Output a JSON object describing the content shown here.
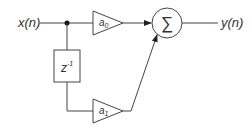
{
  "diagram": {
    "type": "signal-flow block diagram",
    "input_label": "x(n)",
    "output_label": "y(n)",
    "delay": {
      "base": "z",
      "exponent": "-1"
    },
    "gain_top": {
      "base": "a",
      "sub": "0"
    },
    "gain_bottom": {
      "base": "a",
      "sub": "1"
    },
    "sum_symbol": "∑",
    "colors": {
      "stroke": "#444444",
      "text": "#333333",
      "background": "#ffffff"
    }
  }
}
